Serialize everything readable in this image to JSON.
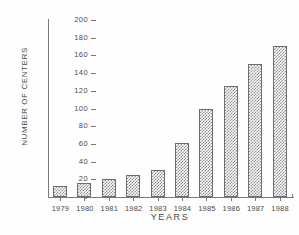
{
  "chart_data": {
    "type": "bar",
    "title": "",
    "xlabel": "YEARS",
    "ylabel": "NUMBER OF CENTERS",
    "categories": [
      "1979",
      "1980",
      "1981",
      "1982",
      "1983",
      "1984",
      "1985",
      "1986",
      "1987",
      "1988"
    ],
    "values": [
      13,
      16,
      20,
      25,
      31,
      61,
      99,
      126,
      150,
      171
    ],
    "ylim": [
      0,
      200
    ],
    "yticks": [
      0,
      20,
      40,
      60,
      80,
      100,
      120,
      140,
      160,
      180,
      200
    ],
    "ytick_labels": [
      "0",
      "20",
      "40",
      "60",
      "80",
      "100",
      "120",
      "140",
      "160",
      "180",
      "200"
    ],
    "grid": false,
    "legend": null,
    "bar_fill": "#8d8d8d",
    "bar_edge": "#6d6d6d",
    "axis_color": "#7a7a7a",
    "text_color": "#4a4a4a",
    "background": "#ffffff"
  }
}
